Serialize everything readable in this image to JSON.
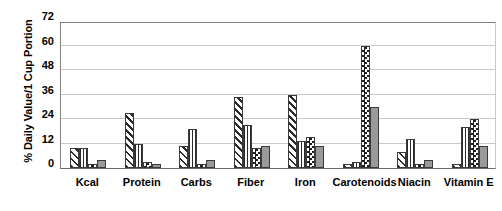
{
  "chart_data": {
    "type": "bar",
    "title": "",
    "subtitle": "",
    "xlabel": "",
    "ylabel": "% Daily Value/1 Cup Portion",
    "ylim": [
      0,
      72
    ],
    "yticks": [
      0,
      12,
      24,
      36,
      48,
      60,
      72
    ],
    "ytick_labels": [
      "0",
      "12",
      "24",
      "36",
      "48",
      "60",
      "72"
    ],
    "grid": true,
    "legend": "none",
    "categories": [
      "Kcal",
      "Protein",
      "Carbs",
      "Fiber",
      "Iron",
      "Carotenoids",
      "Niacin",
      "Vitamin E"
    ],
    "series": [
      {
        "name": "series-1",
        "pattern": "diagonal-hatch",
        "values": [
          10,
          27,
          11,
          35,
          36,
          2,
          8,
          2
        ]
      },
      {
        "name": "series-2",
        "pattern": "cross-grid",
        "values": [
          10,
          12,
          19,
          21,
          13,
          3,
          14,
          20
        ]
      },
      {
        "name": "series-3",
        "pattern": "checkerboard",
        "values": [
          2,
          3,
          2,
          10,
          15,
          60,
          2,
          24
        ]
      },
      {
        "name": "series-4",
        "pattern": "solid-gray",
        "values": [
          4,
          2,
          4,
          11,
          11,
          30,
          4,
          11
        ]
      }
    ]
  },
  "colors": {
    "pattern_dark": "#2b2b2b",
    "solid_gray": "#9a9a9a",
    "gridline": "#c9c9c9",
    "axis": "#6b6b6b",
    "background": "#ffffff",
    "text": "#000000"
  }
}
